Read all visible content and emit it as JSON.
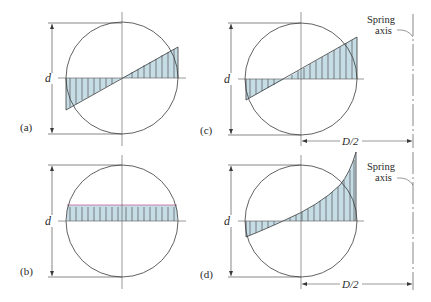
{
  "figure": {
    "panels": [
      {
        "id": "a",
        "label": "(a)",
        "dimension_label": "d",
        "distribution": "linear, zero at center"
      },
      {
        "id": "b",
        "label": "(b)",
        "dimension_label": "d",
        "distribution": "uniform"
      },
      {
        "id": "c",
        "label": "(c)",
        "dimension_label": "d",
        "distribution": "linear, shifted zero",
        "offset_label": "D/2",
        "axis_label_line1": "Spring",
        "axis_label_line2": "axis"
      },
      {
        "id": "d",
        "label": "(d)",
        "dimension_label": "d",
        "distribution": "nonlinear (curved)",
        "offset_label": "D/2",
        "axis_label_line1": "Spring",
        "axis_label_line2": "axis"
      }
    ]
  },
  "colors": {
    "line": "#3a3a3a",
    "fill": "#c6dde6",
    "pink": "#c8649a"
  }
}
